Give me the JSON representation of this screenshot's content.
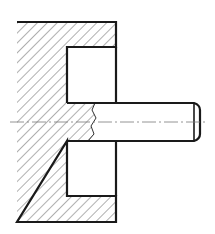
{
  "drawing": {
    "title": "Sectional view of pin pressed into housing",
    "type": "technical-drawing-section",
    "colors": {
      "background": "#ffffff",
      "outline": "#1a1a1a",
      "hatch": "#3a3a3a",
      "centerline": "#7a7a7a"
    },
    "parts": [
      {
        "name": "housing",
        "hatched": true
      },
      {
        "name": "pin",
        "hatched": false,
        "chamfered_end": true
      },
      {
        "name": "upper-pocket",
        "hatched": false
      },
      {
        "name": "lower-pocket",
        "hatched": false
      }
    ],
    "features": {
      "centerline": "dash-dot",
      "break_line": "irregular freehand"
    }
  }
}
